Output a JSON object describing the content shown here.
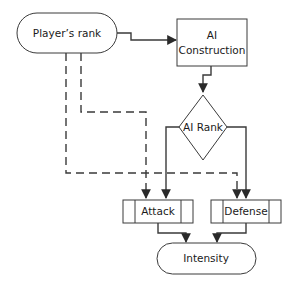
{
  "diagram": {
    "type": "flowchart",
    "colors": {
      "stroke": "#3a3a3a",
      "fill": "#ffffff",
      "text": "#1a1a1a"
    },
    "nodes": [
      {
        "id": "players_rank",
        "shape": "terminator",
        "label": "Player’s rank"
      },
      {
        "id": "ai_construction",
        "shape": "process",
        "label_line1": "AI",
        "label_line2": "Construction"
      },
      {
        "id": "ai_rank",
        "shape": "decision",
        "label": "AI Rank"
      },
      {
        "id": "attack",
        "shape": "predefined-process",
        "label": "Attack"
      },
      {
        "id": "defense",
        "shape": "predefined-process",
        "label": "Defense"
      },
      {
        "id": "intensity",
        "shape": "terminator",
        "label": "Intensity"
      }
    ],
    "edges": [
      {
        "from": "players_rank",
        "to": "ai_construction",
        "style": "solid"
      },
      {
        "from": "ai_construction",
        "to": "ai_rank",
        "style": "solid"
      },
      {
        "from": "ai_rank",
        "to": "attack",
        "style": "solid"
      },
      {
        "from": "ai_rank",
        "to": "defense",
        "style": "solid"
      },
      {
        "from": "players_rank",
        "to": "attack",
        "style": "dashed"
      },
      {
        "from": "players_rank",
        "to": "defense",
        "style": "dashed"
      },
      {
        "from": "attack",
        "to": "intensity",
        "style": "solid"
      },
      {
        "from": "defense",
        "to": "intensity",
        "style": "solid"
      }
    ]
  }
}
